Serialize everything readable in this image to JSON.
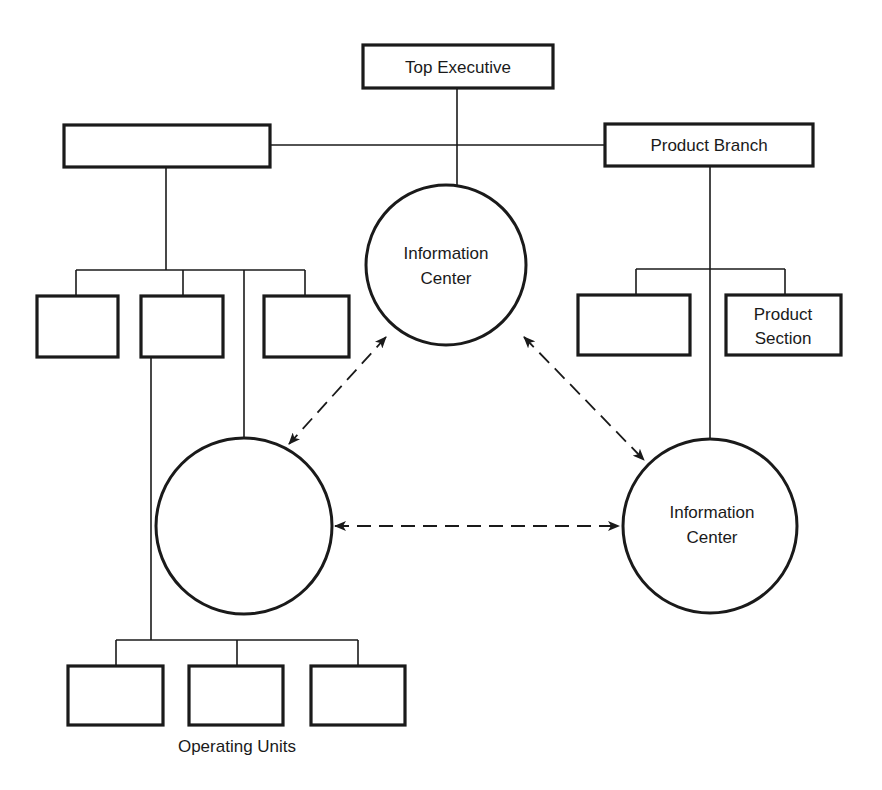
{
  "diagram": {
    "top_executive": {
      "label": "Top Executive"
    },
    "left_branch": {
      "label": ""
    },
    "product_branch": {
      "label": "Product Branch"
    },
    "product_section": {
      "line1": "Product",
      "line2": "Section"
    },
    "info_center_top": {
      "line1": "Information",
      "line2": "Center"
    },
    "info_center_right": {
      "line1": "Information",
      "line2": "Center"
    },
    "info_center_left": {
      "line1": "",
      "line2": ""
    },
    "operating_units": {
      "label": "Operating Units"
    }
  },
  "colors": {
    "stroke": "#1a1a1a",
    "background": "#ffffff"
  }
}
